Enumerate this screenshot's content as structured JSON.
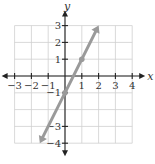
{
  "chart_data": {
    "type": "line",
    "title": "",
    "xlabel": "x",
    "ylabel": "y",
    "xlim": [
      -3,
      4
    ],
    "ylim": [
      -4,
      3
    ],
    "grid": true,
    "x_ticks": [
      -3,
      -2,
      -1,
      1,
      2,
      3,
      4
    ],
    "y_ticks": [
      -4,
      -3,
      -1,
      1,
      2,
      3
    ],
    "x_tick_labels": [
      "−3",
      "−2",
      "−1",
      "1",
      "2",
      "3",
      "4"
    ],
    "y_tick_labels": [
      "−4",
      "−3",
      "−1",
      "1",
      "2",
      "3"
    ],
    "series": [
      {
        "name": "y = 2x − 1",
        "equation": "y = 2x - 1",
        "slope": 2,
        "intercept": -1,
        "x": [
          -1.5,
          2
        ],
        "y": [
          -4,
          3
        ],
        "arrows": "both",
        "color": "#9a9a9a"
      }
    ],
    "marked_points": [
      {
        "x": 0,
        "y": -1
      },
      {
        "x": 1,
        "y": 1
      }
    ]
  }
}
